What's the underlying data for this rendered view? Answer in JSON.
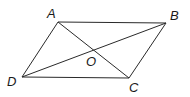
{
  "diagram": {
    "type": "parallelogram-with-diagonals",
    "stroke_color": "#2a2a2a",
    "vertices": {
      "A": {
        "label": "A",
        "x": 58,
        "y": 22,
        "label_x": 47,
        "label_y": 18
      },
      "B": {
        "label": "B",
        "x": 166,
        "y": 23,
        "label_x": 170,
        "label_y": 20
      },
      "C": {
        "label": "C",
        "x": 129,
        "y": 78,
        "label_x": 129,
        "label_y": 92
      },
      "D": {
        "label": "D",
        "x": 22,
        "y": 77,
        "label_x": 7,
        "label_y": 86
      },
      "O": {
        "label": "O",
        "x": 94,
        "y": 50,
        "label_x": 86,
        "label_y": 66
      }
    },
    "sides": [
      "AB",
      "BC",
      "CD",
      "DA"
    ],
    "diagonals": [
      "AC",
      "BD"
    ]
  }
}
